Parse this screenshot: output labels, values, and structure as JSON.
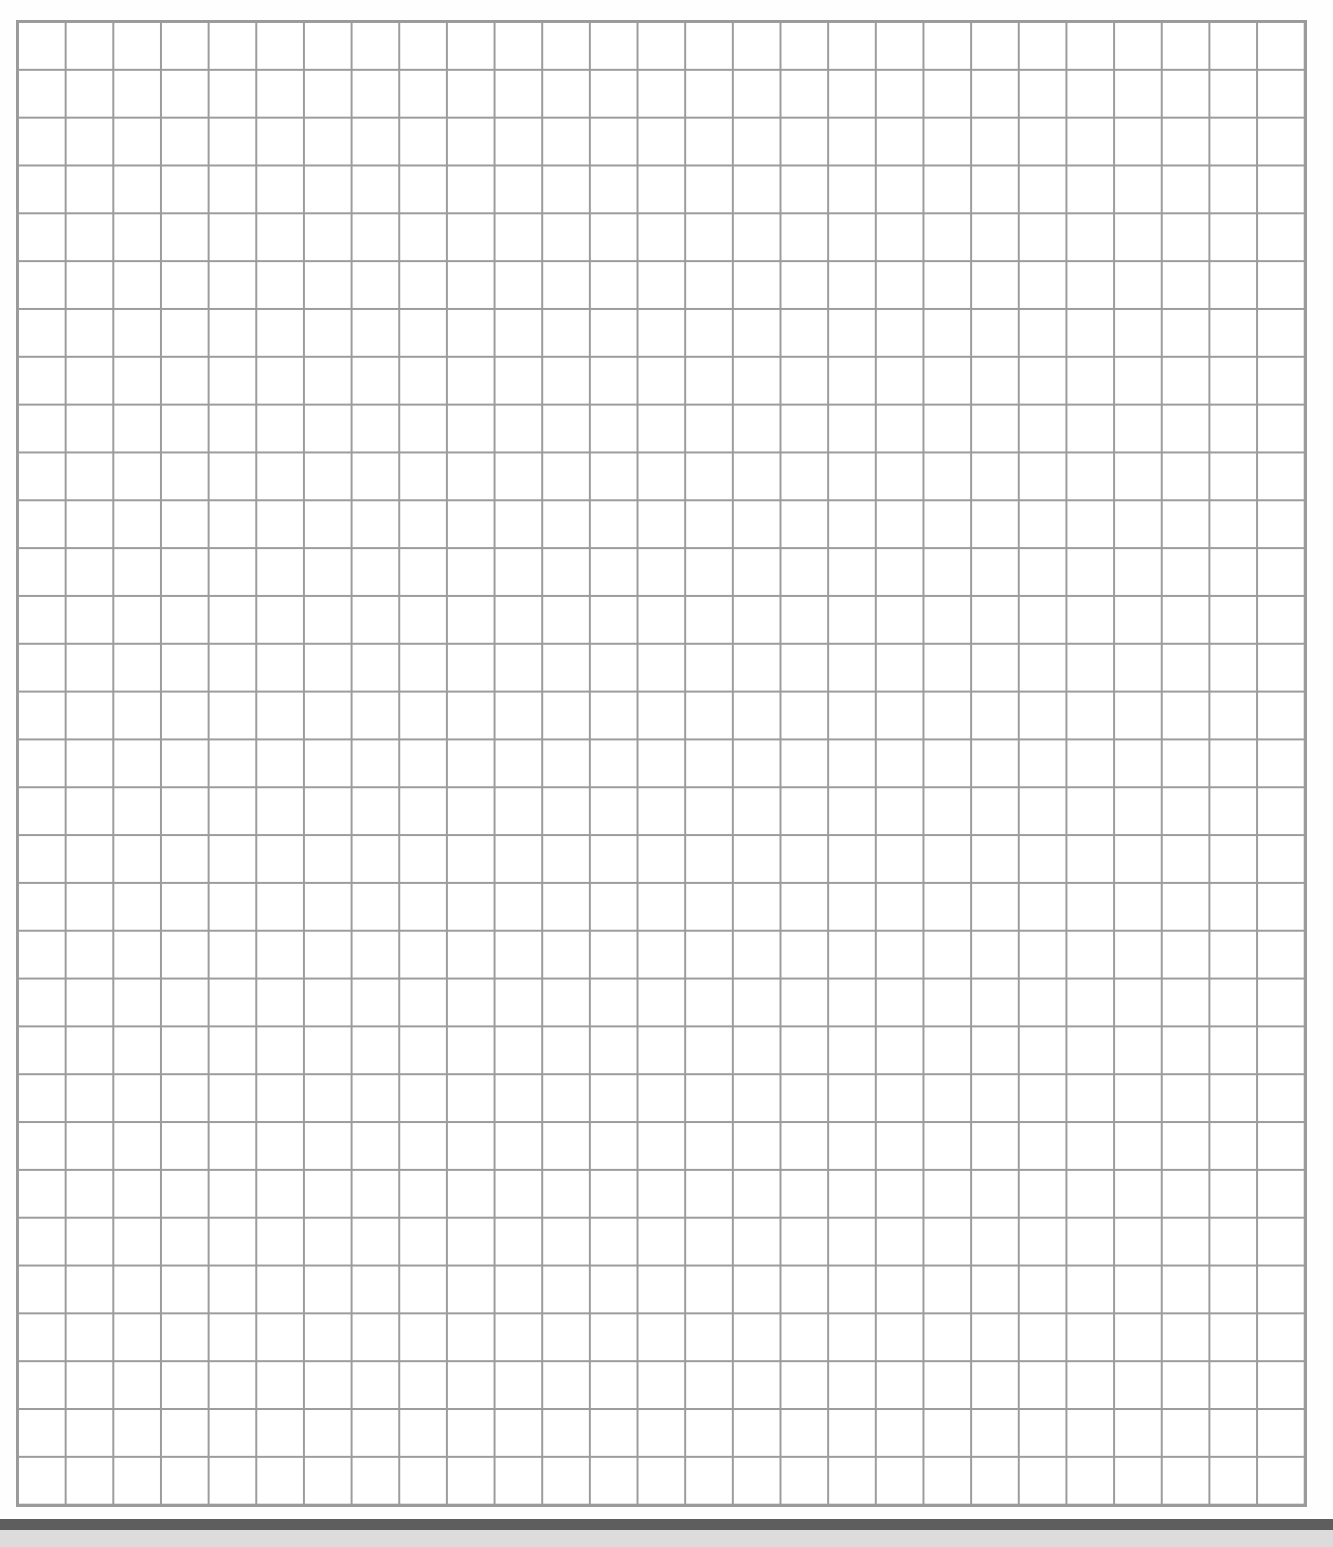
{
  "page": {
    "type": "graph-paper",
    "grid": {
      "columns": 27,
      "rows": 31,
      "line_color": "#9c9c9c",
      "background_color": "#ffffff"
    },
    "bottom_edge": {
      "dark_band_color": "#5e5e5e",
      "light_band_color": "#dcdcdc"
    }
  }
}
